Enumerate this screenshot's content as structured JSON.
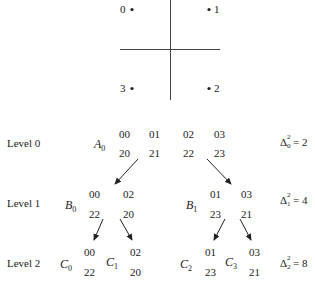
{
  "constellation": {
    "points": [
      {
        "label": "0",
        "side": "left"
      },
      {
        "label": "1",
        "side": "right"
      },
      {
        "label": "3",
        "side": "left"
      },
      {
        "label": "2",
        "side": "right"
      }
    ]
  },
  "levels": [
    {
      "label": "Level 0",
      "delta": {
        "symbol": "Δ",
        "sup": "2",
        "sub": "0",
        "value": "= 2"
      },
      "sets": [
        {
          "name": "A",
          "sub": "0",
          "rows": [
            [
              "00",
              "01",
              "02",
              "03"
            ],
            [
              "20",
              "21",
              "22",
              "23"
            ]
          ]
        }
      ]
    },
    {
      "label": "Level 1",
      "delta": {
        "symbol": "Δ",
        "sup": "2",
        "sub": "1",
        "value": "= 4"
      },
      "sets": [
        {
          "name": "B",
          "sub": "0",
          "rows": [
            [
              "00",
              "02"
            ],
            [
              "22",
              "20"
            ]
          ]
        },
        {
          "name": "B",
          "sub": "1",
          "rows": [
            [
              "01",
              "03"
            ],
            [
              "23",
              "21"
            ]
          ]
        }
      ]
    },
    {
      "label": "Level 2",
      "delta": {
        "symbol": "Δ",
        "sup": "2",
        "sub": "2",
        "value": "= 8"
      },
      "sets": [
        {
          "name": "C",
          "sub": "0",
          "rows": [
            [
              "00"
            ],
            [
              "22"
            ]
          ]
        },
        {
          "name": "C",
          "sub": "1",
          "rows": [
            [
              "02"
            ],
            [
              "20"
            ]
          ]
        },
        {
          "name": "C",
          "sub": "2",
          "rows": [
            [
              "01"
            ],
            [
              "23"
            ]
          ]
        },
        {
          "name": "C",
          "sub": "3",
          "rows": [
            [
              "03"
            ],
            [
              "21"
            ]
          ]
        }
      ]
    }
  ]
}
